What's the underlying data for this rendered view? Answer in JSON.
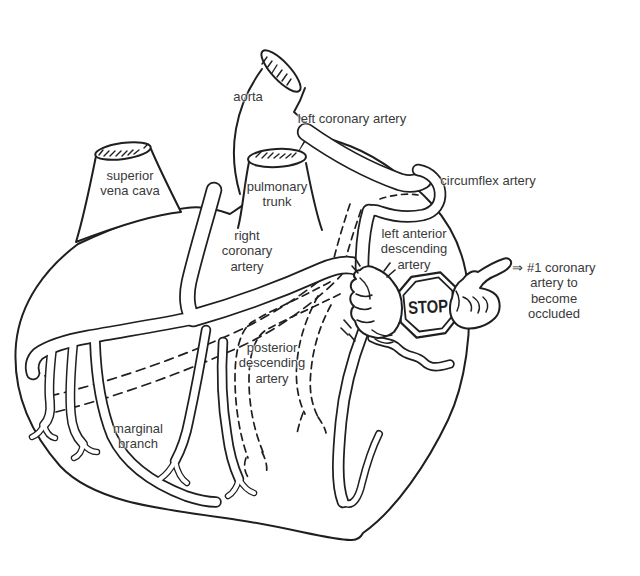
{
  "labels": {
    "aorta": "aorta",
    "left_coronary_artery": "left coronary artery",
    "superior_vena_cava": "superior\nvena cava",
    "pulmonary_trunk": "pulmonary\ntrunk",
    "circumflex_artery": "circumflex artery",
    "right_coronary_artery": "right\ncoronary\nartery",
    "left_anterior_descending_artery": "left anterior\ndescending\nartery",
    "posterior_descending_artery": "posterior\ndescending\nartery",
    "marginal_branch": "marginal\nbranch",
    "occlusion_note": "⇒ #1 coronary\nartery to\nbecome occluded"
  },
  "stop_sign": {
    "text": "STOP"
  },
  "icons": {
    "stop_sign_icon": "octagonal STOP road sign held over the artery",
    "fist_icon": "fist squeezing the left anterior descending artery",
    "pointing_hand_icon": "hand with index finger pointing at the note"
  },
  "colors": {
    "ink": "#1f1f1f",
    "label_text": "#3a3a3a",
    "background": "#ffffff"
  }
}
